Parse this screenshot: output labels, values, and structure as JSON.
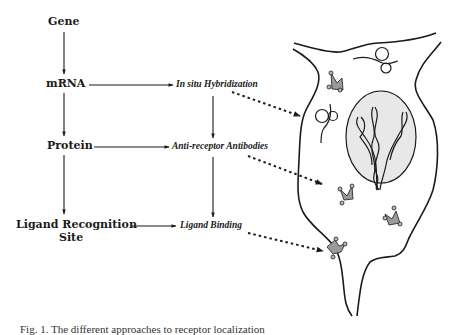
{
  "diagram": {
    "left_column": [
      {
        "id": "gene",
        "label": "Gene"
      },
      {
        "id": "mrna",
        "label": "mRNA"
      },
      {
        "id": "protein",
        "label": "Protein"
      },
      {
        "id": "ligand-recognition-site",
        "label_line1": "Ligand Recognition",
        "label_line2": "Site"
      }
    ],
    "middle_column": [
      {
        "id": "in-situ-hybridization",
        "label": "In situ Hybridization"
      },
      {
        "id": "anti-receptor-antibodies",
        "label": "Anti-receptor Antibodies"
      },
      {
        "id": "ligand-binding",
        "label": "Ligand Binding"
      }
    ],
    "cell": {
      "nucleus_fill": "#e8e8e8",
      "receptor_fill": "#9a9a9a",
      "stroke": "#1a1a1a"
    }
  },
  "caption": {
    "text": "Fig. 1. The different approaches to receptor localization"
  }
}
